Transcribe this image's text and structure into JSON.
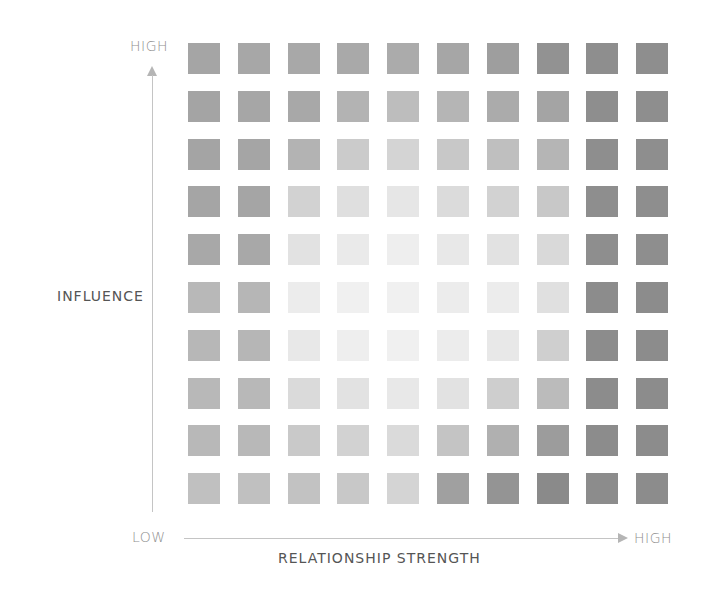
{
  "diagram": {
    "y_axis": {
      "title": "INFLUENCE",
      "high_label": "HIGH"
    },
    "x_axis": {
      "title": "RELATIONSHIP STRENGTH",
      "low_label": "LOW",
      "high_label": "HIGH"
    }
  },
  "chart_data": {
    "type": "heatmap",
    "title": "",
    "xlabel": "RELATIONSHIP STRENGTH",
    "ylabel": "INFLUENCE",
    "x_range_labels": [
      "LOW",
      "HIGH"
    ],
    "y_range_labels": [
      "LOW",
      "HIGH"
    ],
    "rows": 10,
    "cols": 10,
    "row_order": "top = HIGH influence",
    "cell_colors": [
      [
        "#a5a5a5",
        "#a7a7a7",
        "#a8a8a8",
        "#a9a9a9",
        "#ababab",
        "#a6a6a6",
        "#9e9e9e",
        "#929292",
        "#8e8e8e",
        "#8e8e8e"
      ],
      [
        "#a4a4a4",
        "#a6a6a6",
        "#a8a8a8",
        "#b3b3b3",
        "#bdbdbd",
        "#b5b5b5",
        "#ababab",
        "#a4a4a4",
        "#8e8e8e",
        "#8e8e8e"
      ],
      [
        "#a4a4a4",
        "#a5a5a5",
        "#b3b3b3",
        "#cbcbcb",
        "#d4d4d4",
        "#c8c8c8",
        "#bfbfbf",
        "#b5b5b5",
        "#8e8e8e",
        "#8e8e8e"
      ],
      [
        "#a5a5a5",
        "#a5a5a5",
        "#d2d2d2",
        "#dfdfdf",
        "#e6e6e6",
        "#dbdbdb",
        "#d2d2d2",
        "#c8c8c8",
        "#8e8e8e",
        "#8e8e8e"
      ],
      [
        "#a8a8a8",
        "#a8a8a8",
        "#e2e2e2",
        "#eaeaea",
        "#eeeeee",
        "#e8e8e8",
        "#e2e2e2",
        "#d9d9d9",
        "#8e8e8e",
        "#8e8e8e"
      ],
      [
        "#b8b8b8",
        "#b6b6b6",
        "#ececec",
        "#f0f0f0",
        "#f0f0f0",
        "#ececec",
        "#ececec",
        "#e0e0e0",
        "#8c8c8c",
        "#8c8c8c"
      ],
      [
        "#b7b7b7",
        "#b6b6b6",
        "#e8e8e8",
        "#eeeeee",
        "#f0f0f0",
        "#ececec",
        "#e8e8e8",
        "#cfcfcf",
        "#8c8c8c",
        "#8c8c8c"
      ],
      [
        "#b8b8b8",
        "#b8b8b8",
        "#dadada",
        "#e2e2e2",
        "#e8e8e8",
        "#e2e2e2",
        "#cecece",
        "#bbbbbb",
        "#8c8c8c",
        "#8c8c8c"
      ],
      [
        "#b8b8b8",
        "#b8b8b8",
        "#c9c9c9",
        "#d2d2d2",
        "#dadada",
        "#c4c4c4",
        "#b0b0b0",
        "#9c9c9c",
        "#8c8c8c",
        "#8c8c8c"
      ],
      [
        "#c0c0c0",
        "#c0c0c0",
        "#c2c2c2",
        "#c8c8c8",
        "#d4d4d4",
        "#a0a0a0",
        "#949494",
        "#8a8a8a",
        "#8c8c8c",
        "#8c8c8c"
      ]
    ],
    "grid": false,
    "legend": null
  }
}
